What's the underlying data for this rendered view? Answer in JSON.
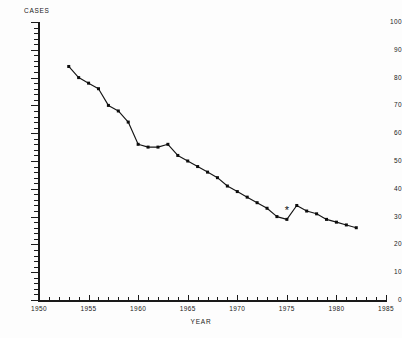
{
  "chart_data": {
    "type": "line",
    "title": "",
    "xlabel": "YEAR",
    "ylabel": "CASES",
    "xlim": [
      1950,
      1985
    ],
    "ylim": [
      0,
      100
    ],
    "grid": false,
    "legend": null,
    "x_ticks": [
      1950,
      1955,
      1960,
      1965,
      1970,
      1975,
      1980,
      1985
    ],
    "y_ticks": [
      0,
      10,
      20,
      30,
      40,
      50,
      60,
      70,
      80,
      90,
      100
    ],
    "x_minor_tick_interval": 1,
    "y_minor_tick_interval": 2,
    "series": [
      {
        "name": "cases",
        "marker": "square",
        "x": [
          1953,
          1954,
          1955,
          1956,
          1957,
          1958,
          1959,
          1960,
          1961,
          1962,
          1963,
          1964,
          1965,
          1966,
          1967,
          1968,
          1969,
          1970,
          1971,
          1972,
          1973,
          1974,
          1975,
          1976,
          1977,
          1978,
          1979,
          1980,
          1981,
          1982
        ],
        "y": [
          84,
          80,
          78,
          76,
          70,
          68,
          64,
          56,
          55,
          55,
          56,
          52,
          50,
          48,
          46,
          44,
          41,
          39,
          37,
          35,
          33,
          30,
          29,
          34,
          32,
          31,
          29,
          28,
          27,
          26
        ]
      }
    ],
    "annotations": [
      {
        "label": "*",
        "x": 1975,
        "y": 31,
        "marker": "asterisk"
      }
    ]
  },
  "axis_titles": {
    "y": "CASES",
    "x": "YEAR"
  }
}
